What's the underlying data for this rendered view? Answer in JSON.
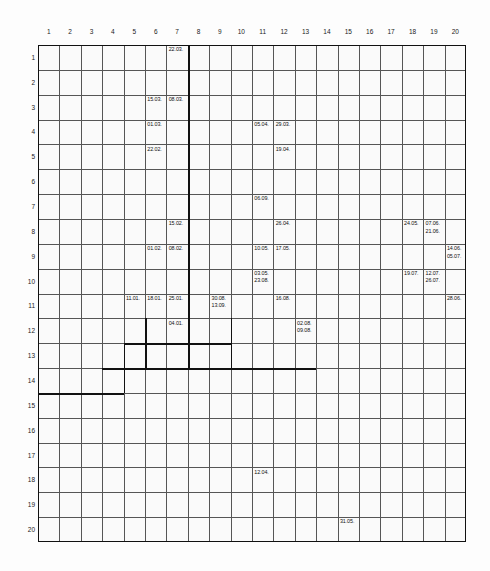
{
  "sheet": {
    "title": "grid-date-sheet",
    "grid_cols": 20,
    "grid_rows": 20,
    "line_color": "#555555",
    "heavy_line_color": "#111111",
    "background": "#fafafa"
  },
  "columns": [
    "1",
    "2",
    "3",
    "4",
    "5",
    "6",
    "7",
    "8",
    "9",
    "10",
    "11",
    "12",
    "13",
    "14",
    "15",
    "16",
    "17",
    "18",
    "19",
    "20"
  ],
  "rows": [
    "1",
    "2",
    "3",
    "4",
    "5",
    "6",
    "7",
    "8",
    "9",
    "10",
    "11",
    "12",
    "13",
    "14",
    "15",
    "16",
    "17",
    "18",
    "19",
    "20"
  ],
  "entries": [
    {
      "row": 1,
      "col": 7,
      "dates": [
        "22.03."
      ]
    },
    {
      "row": 3,
      "col": 6,
      "dates": [
        "15.03."
      ]
    },
    {
      "row": 3,
      "col": 7,
      "dates": [
        "08.03."
      ]
    },
    {
      "row": 4,
      "col": 6,
      "dates": [
        "01.03."
      ]
    },
    {
      "row": 4,
      "col": 11,
      "dates": [
        "05.04."
      ]
    },
    {
      "row": 4,
      "col": 12,
      "dates": [
        "29.03."
      ]
    },
    {
      "row": 5,
      "col": 6,
      "dates": [
        "22.02."
      ]
    },
    {
      "row": 5,
      "col": 12,
      "dates": [
        "19.04."
      ]
    },
    {
      "row": 7,
      "col": 11,
      "dates": [
        "06.09."
      ]
    },
    {
      "row": 8,
      "col": 7,
      "dates": [
        "15.02."
      ]
    },
    {
      "row": 8,
      "col": 12,
      "dates": [
        "26.04."
      ]
    },
    {
      "row": 8,
      "col": 18,
      "dates": [
        "24.05."
      ]
    },
    {
      "row": 8,
      "col": 19,
      "dates": [
        "07.06.",
        "21.06."
      ]
    },
    {
      "row": 9,
      "col": 6,
      "dates": [
        "01.02."
      ]
    },
    {
      "row": 9,
      "col": 7,
      "dates": [
        "08.02."
      ]
    },
    {
      "row": 9,
      "col": 11,
      "dates": [
        "10.05."
      ]
    },
    {
      "row": 9,
      "col": 12,
      "dates": [
        "17.05."
      ]
    },
    {
      "row": 9,
      "col": 20,
      "dates": [
        "14.06.",
        "05.07."
      ]
    },
    {
      "row": 10,
      "col": 11,
      "dates": [
        "03.05.",
        "23.08."
      ]
    },
    {
      "row": 10,
      "col": 18,
      "dates": [
        "19.07."
      ]
    },
    {
      "row": 10,
      "col": 19,
      "dates": [
        "12.07.",
        "26.07."
      ]
    },
    {
      "row": 11,
      "col": 5,
      "dates": [
        "11.01."
      ]
    },
    {
      "row": 11,
      "col": 6,
      "dates": [
        "18.01."
      ]
    },
    {
      "row": 11,
      "col": 7,
      "dates": [
        "25.01."
      ]
    },
    {
      "row": 11,
      "col": 9,
      "dates": [
        "30.08.",
        "13.09."
      ]
    },
    {
      "row": 11,
      "col": 12,
      "dates": [
        "16.08."
      ]
    },
    {
      "row": 11,
      "col": 20,
      "dates": [
        "28.06."
      ]
    },
    {
      "row": 12,
      "col": 7,
      "dates": [
        "04.01."
      ]
    },
    {
      "row": 12,
      "col": 13,
      "dates": [
        "02.08.",
        "09.08."
      ]
    },
    {
      "row": 18,
      "col": 11,
      "dates": [
        "12.04."
      ]
    },
    {
      "row": 20,
      "col": 15,
      "dates": [
        "31.05."
      ]
    }
  ],
  "heavy_vertical_segments": [
    {
      "col_boundary": 7,
      "row_start": 1,
      "row_end": 13
    },
    {
      "col_boundary": 5,
      "row_start": 12,
      "row_end": 13
    },
    {
      "col_boundary": 9,
      "row_start": 12,
      "row_end": 13
    },
    {
      "col_boundary": 4,
      "row_start": 13,
      "row_end": 14
    }
  ],
  "heavy_horizontal_segments": [
    {
      "row_boundary": 12,
      "col_start": 5,
      "col_end": 9
    },
    {
      "row_boundary": 13,
      "col_start": 4,
      "col_end": 13
    },
    {
      "row_boundary": 14,
      "col_start": 1,
      "col_end": 4
    }
  ]
}
